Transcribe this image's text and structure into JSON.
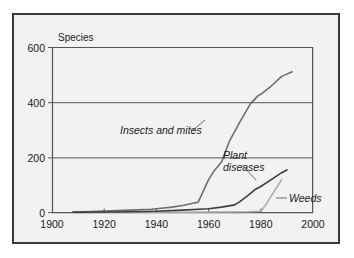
{
  "figure": {
    "background_color": "#ffffff",
    "plot_background_color": "#f2f2f2",
    "frame_color": "#3a3a3a"
  },
  "chart_data": {
    "type": "line",
    "title": "",
    "ylabel": "Species",
    "xlabel": "",
    "xlim": [
      1900,
      2000
    ],
    "ylim": [
      0,
      600
    ],
    "xticks": [
      "1900",
      "1920",
      "1940",
      "1960",
      "1980",
      "2000"
    ],
    "yticks": [
      "0",
      "200",
      "400",
      "600"
    ],
    "grid": "horizontal",
    "legend": "inline-annotations",
    "series": [
      {
        "name": "Insects and mites",
        "color": "#6e6e6e",
        "label_position": "mid-left",
        "x": [
          1908,
          1915,
          1920,
          1930,
          1938,
          1940,
          1946,
          1950,
          1954,
          1956,
          1960,
          1962,
          1965,
          1968,
          1972,
          1976,
          1979,
          1980,
          1984,
          1988,
          1992
        ],
        "y": [
          2,
          4,
          6,
          9,
          12,
          14,
          20,
          26,
          34,
          38,
          120,
          150,
          185,
          260,
          330,
          395,
          425,
          430,
          460,
          495,
          512
        ]
      },
      {
        "name": "Plant diseases",
        "color": "#3d3d3d",
        "label_position": "mid-right",
        "x": [
          1908,
          1920,
          1930,
          1940,
          1950,
          1960,
          1965,
          1970,
          1972,
          1975,
          1978,
          1980,
          1984,
          1988,
          1990
        ],
        "y": [
          1,
          2,
          3,
          5,
          9,
          14,
          20,
          28,
          40,
          62,
          85,
          95,
          120,
          145,
          155
        ]
      },
      {
        "name": "Weeds",
        "color": "#a8a8a8",
        "label_position": "bottom-right",
        "x": [
          1908,
          1930,
          1950,
          1965,
          1975,
          1980,
          1982,
          1985,
          1988
        ],
        "y": [
          0,
          1,
          1,
          2,
          3,
          5,
          30,
          75,
          120
        ]
      }
    ],
    "annotations": [
      {
        "text": "Insects and mites",
        "leader": true
      },
      {
        "text_line1": "Plant",
        "text_line2": "diseases",
        "leader": true
      },
      {
        "text": "Weeds",
        "leader": true
      }
    ]
  }
}
